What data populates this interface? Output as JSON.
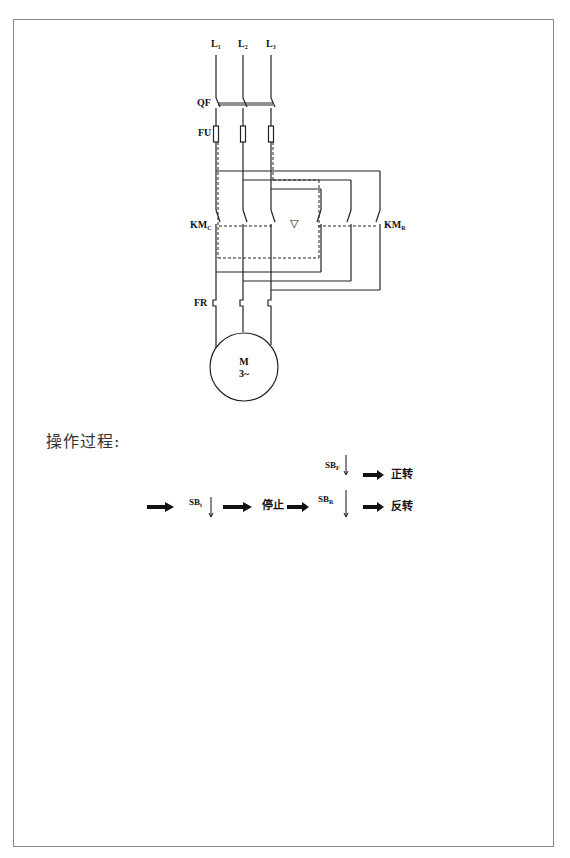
{
  "diagram": {
    "labels": {
      "l1": {
        "main": "L",
        "sub": "1"
      },
      "l2": {
        "main": "L",
        "sub": "2"
      },
      "l3": {
        "main": "L",
        "sub": "3"
      },
      "qf": "QF",
      "fu": "FU",
      "km_c": {
        "main": "KM",
        "sub": "C"
      },
      "km_r": {
        "main": "KM",
        "sub": "R"
      },
      "interlock_symbol": "▽",
      "fr": "FR",
      "motor": {
        "line1": "M",
        "line2": "3~"
      }
    }
  },
  "operation": {
    "title": "操作过程:",
    "sb_stop": {
      "main": "SB",
      "sub": "t"
    },
    "stop_text": "停止",
    "sb_forward": {
      "main": "SB",
      "sub": "F"
    },
    "forward_text": "正转",
    "sb_reverse": {
      "main": "SB",
      "sub": "R"
    },
    "reverse_text": "反转"
  }
}
